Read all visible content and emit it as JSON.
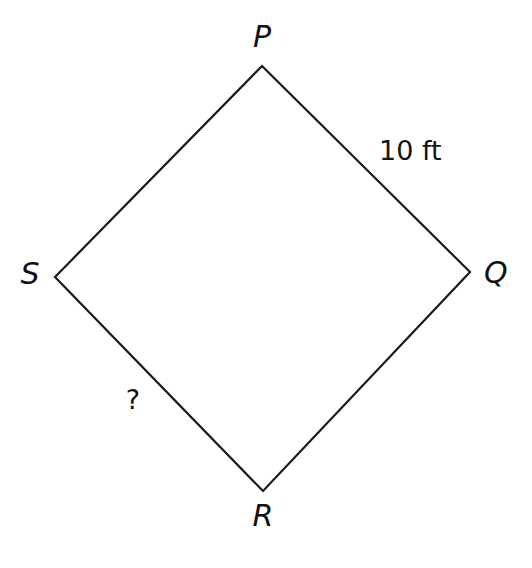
{
  "figure": {
    "kind": "quadrilateral-diagram",
    "shape_name": "rhombus PQRS",
    "background_color": "#ffffff",
    "stroke_color": "#1a1a1a",
    "stroke_width": 2.2,
    "vertices": [
      {
        "name": "P",
        "label": "P",
        "x": 262,
        "y": 66,
        "position": "top"
      },
      {
        "name": "Q",
        "label": "Q",
        "x": 470,
        "y": 272,
        "position": "right"
      },
      {
        "name": "R",
        "label": "R",
        "x": 263,
        "y": 491,
        "position": "bottom"
      },
      {
        "name": "S",
        "label": "S",
        "x": 55,
        "y": 277,
        "position": "left"
      }
    ],
    "edges": [
      {
        "name": "PQ",
        "from": "P",
        "to": "Q",
        "measure_label": "10 ft"
      },
      {
        "name": "QR",
        "from": "Q",
        "to": "R",
        "measure_label": ""
      },
      {
        "name": "RS",
        "from": "R",
        "to": "S",
        "measure_label": "?"
      },
      {
        "name": "SP",
        "from": "S",
        "to": "P",
        "measure_label": ""
      }
    ],
    "annotations": {
      "side_pq_length": "10 ft",
      "side_sr_unknown": "?"
    }
  }
}
